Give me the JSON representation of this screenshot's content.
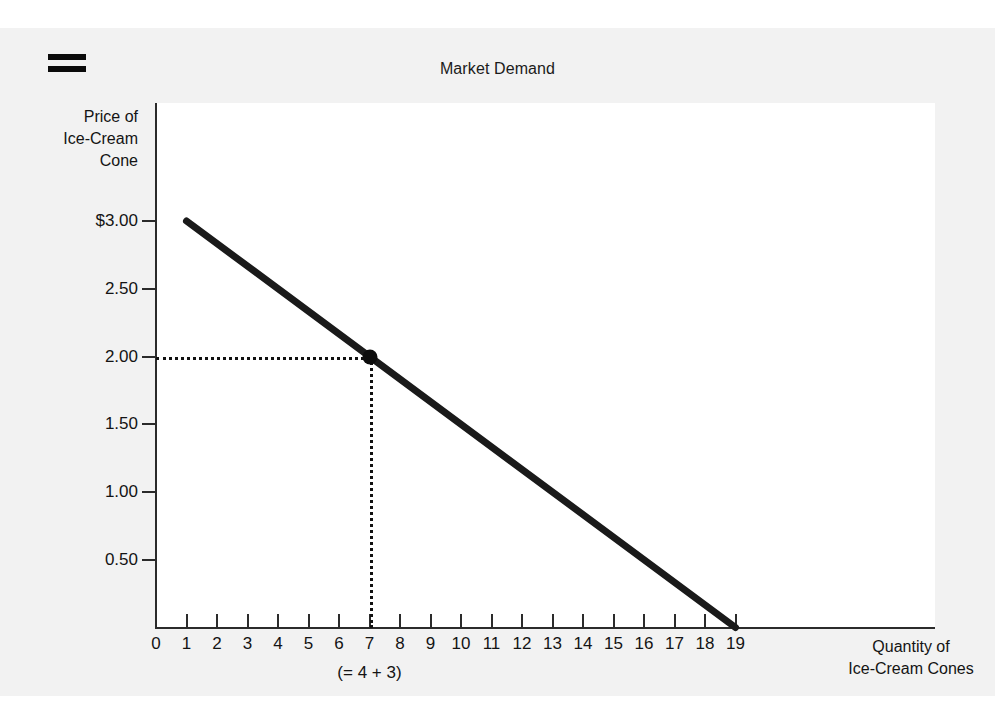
{
  "window": {
    "background_color": "#f2f2f2",
    "plot_background_color": "#ffffff"
  },
  "header": {
    "title": "Market Demand",
    "menu_icon": "hamburger-menu-icon"
  },
  "chart_data": {
    "type": "line",
    "title": "Market Demand",
    "xlabel": "Quantity of Ice-Cream Cones",
    "ylabel": "Price of Ice-Cream Cone",
    "xlabel_lines": [
      "Quantity of",
      "Ice-Cream Cones"
    ],
    "ylabel_lines": [
      "Price of",
      "Ice-Cream",
      "Cone"
    ],
    "xlim": [
      0,
      19.6
    ],
    "ylim": [
      0,
      3.25
    ],
    "grid": false,
    "legend": null,
    "x_ticks": [
      0,
      1,
      2,
      3,
      4,
      5,
      6,
      7,
      8,
      9,
      10,
      11,
      12,
      13,
      14,
      15,
      16,
      17,
      18,
      19
    ],
    "x_tick_labels": [
      "0",
      "1",
      "2",
      "3",
      "4",
      "5",
      "6",
      "7",
      "8",
      "9",
      "10",
      "11",
      "12",
      "13",
      "14",
      "15",
      "16",
      "17",
      "18",
      "19"
    ],
    "y_ticks": [
      0.5,
      1.0,
      1.5,
      2.0,
      2.5,
      3.0
    ],
    "y_tick_labels": [
      "0.50",
      "1.00",
      "1.50",
      "2.00",
      "2.50",
      "$3.00"
    ],
    "series": [
      {
        "name": "Market Demand",
        "color": "#1a1a1a",
        "points": [
          {
            "x": 1,
            "y": 3.0
          },
          {
            "x": 19,
            "y": 0.0
          }
        ]
      }
    ],
    "highlight_point": {
      "x": 7,
      "y": 2.0,
      "color": "#0d0d0d"
    },
    "guides": [
      {
        "type": "horizontal",
        "from_axis": "y",
        "value": 2.0,
        "to_x": 7,
        "style": "dotted"
      },
      {
        "type": "vertical",
        "from_axis": "x",
        "value": 7,
        "to_y": 2.0,
        "style": "dotted"
      }
    ],
    "annotations": [
      {
        "text": "(= 4 + 3)",
        "x": 7,
        "position": "below-axis"
      }
    ]
  }
}
